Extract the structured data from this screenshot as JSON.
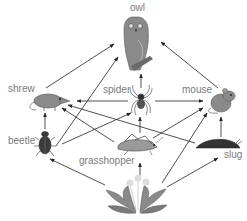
{
  "colors": {
    "arrow": "#222222",
    "label": "#7a7a7a",
    "animal": "#8a8a8a",
    "dark": "#333333",
    "plant": "#9a9a9a",
    "flower": "#d8d8d8"
  },
  "nodes": {
    "owl": {
      "label": "owl"
    },
    "shrew": {
      "label": "shrew"
    },
    "spider": {
      "label": "spider"
    },
    "mouse": {
      "label": "mouse"
    },
    "beetle": {
      "label": "beetle"
    },
    "grasshopper": {
      "label": "grasshopper"
    },
    "slug": {
      "label": "slug"
    },
    "dandelion": {
      "label": ""
    }
  },
  "edges": [
    {
      "from": "shrew",
      "to": "owl"
    },
    {
      "from": "spider",
      "to": "owl"
    },
    {
      "from": "beetle",
      "to": "owl"
    },
    {
      "from": "mouse",
      "to": "owl"
    },
    {
      "from": "spider",
      "to": "shrew"
    },
    {
      "from": "grasshopper",
      "to": "shrew"
    },
    {
      "from": "slug",
      "to": "shrew"
    },
    {
      "from": "beetle",
      "to": "shrew"
    },
    {
      "from": "spider",
      "to": "mouse"
    },
    {
      "from": "grasshopper",
      "to": "mouse"
    },
    {
      "from": "slug",
      "to": "mouse"
    },
    {
      "from": "dandelion",
      "to": "mouse"
    },
    {
      "from": "beetle",
      "to": "spider"
    },
    {
      "from": "grasshopper",
      "to": "spider"
    },
    {
      "from": "dandelion",
      "to": "beetle"
    },
    {
      "from": "dandelion",
      "to": "grasshopper"
    },
    {
      "from": "dandelion",
      "to": "slug"
    }
  ]
}
